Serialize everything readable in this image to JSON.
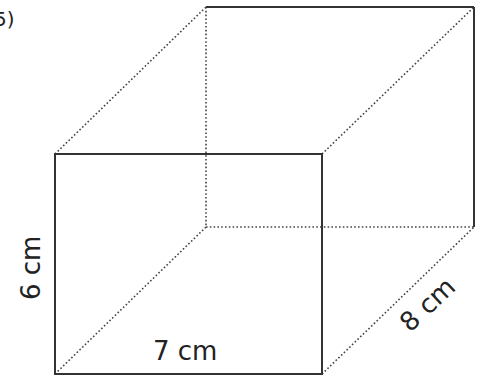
{
  "question": {
    "number_label": "5)"
  },
  "figure": {
    "type": "cuboid",
    "dimensions": {
      "height": "6 cm",
      "width": "7 cm",
      "depth": "8 cm"
    },
    "vertices": {
      "front_top_left": [
        55,
        154
      ],
      "front_top_right": [
        322,
        154
      ],
      "front_bottom_left": [
        55,
        374
      ],
      "front_bottom_right": [
        322,
        374
      ],
      "back_top_left": [
        206,
        7
      ],
      "back_top_right": [
        474,
        7
      ],
      "back_bottom_left": [
        206,
        227
      ],
      "back_bottom_right": [
        474,
        227
      ]
    },
    "line_color": "#333333"
  }
}
